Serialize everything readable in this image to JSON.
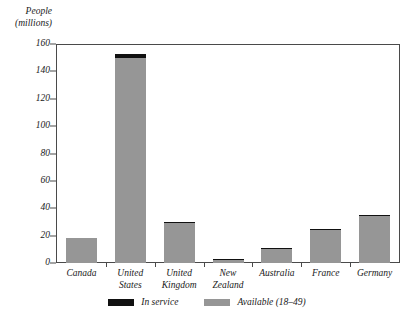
{
  "chart_data": {
    "type": "bar",
    "title": "",
    "subtitle": "",
    "xlabel": "",
    "ylabel": "People (millions)",
    "ylabel_line1": "People",
    "ylabel_line2": "(millions)",
    "grid": false,
    "legend_position": "bottom",
    "ylim": [
      0,
      160
    ],
    "yticks": [
      0,
      20,
      40,
      60,
      80,
      100,
      120,
      140,
      160
    ],
    "ytick_labels": [
      "0",
      "20",
      "40",
      "60",
      "80",
      "100",
      "120",
      "140",
      "160"
    ],
    "categories": [
      "Canada",
      "United States",
      "United Kingdom",
      "New Zealand",
      "Australia",
      "France",
      "Germany"
    ],
    "category_lines": [
      [
        "Canada"
      ],
      [
        "United",
        "States"
      ],
      [
        "United",
        "Kingdom"
      ],
      [
        "New",
        "Zealand"
      ],
      [
        "Australia"
      ],
      [
        "France"
      ],
      [
        "Germany"
      ]
    ],
    "series": [
      {
        "name": "Available (18–49)",
        "color": "#969696",
        "values": [
          18,
          153,
          30,
          3,
          11,
          25,
          35
        ]
      },
      {
        "name": "In service",
        "color": "#111111",
        "values": [
          0,
          3,
          1,
          0.3,
          0.5,
          1,
          1
        ]
      }
    ],
    "legend": [
      {
        "label": "In service",
        "color": "#111111"
      },
      {
        "label": "Available (18–49)",
        "color": "#969696"
      }
    ]
  }
}
